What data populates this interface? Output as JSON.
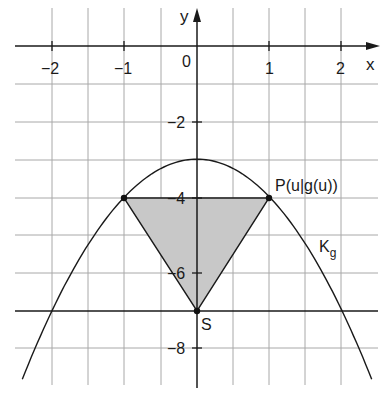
{
  "diagram": {
    "axes": {
      "x_label": "x",
      "y_label": "y",
      "origin_label": "0",
      "x_ticks": [
        {
          "value": -2,
          "label": "−2"
        },
        {
          "value": -1,
          "label": "−1"
        },
        {
          "value": 1,
          "label": "1"
        },
        {
          "value": 2,
          "label": "2"
        }
      ],
      "y_ticks": [
        {
          "value": -2,
          "label": "−2"
        },
        {
          "value": -4,
          "label": "−4"
        },
        {
          "value": -6,
          "label": "−6"
        },
        {
          "value": -8,
          "label": "−8"
        }
      ]
    },
    "curve": {
      "name": "K_g",
      "label_main": "K",
      "label_sub": "g",
      "equation": "g(x) = -x^2 - 3",
      "vertex": [
        0,
        -3
      ]
    },
    "horizontal_line": {
      "y": -7
    },
    "points": {
      "P": {
        "label": "P(u|g(u))",
        "x": 1,
        "y": -4
      },
      "P_mirror": {
        "x": -1,
        "y": -4
      },
      "S": {
        "label": "S",
        "x": 0,
        "y": -7
      }
    },
    "triangle": {
      "vertices": [
        [
          -1,
          -4
        ],
        [
          1,
          -4
        ],
        [
          0,
          -7
        ]
      ],
      "fill": "#c8c8c8"
    },
    "colors": {
      "grid": "#9a9a9a",
      "axis": "#1a1a1a",
      "curve": "#1a1a1a",
      "fill": "#c8c8c8"
    }
  }
}
